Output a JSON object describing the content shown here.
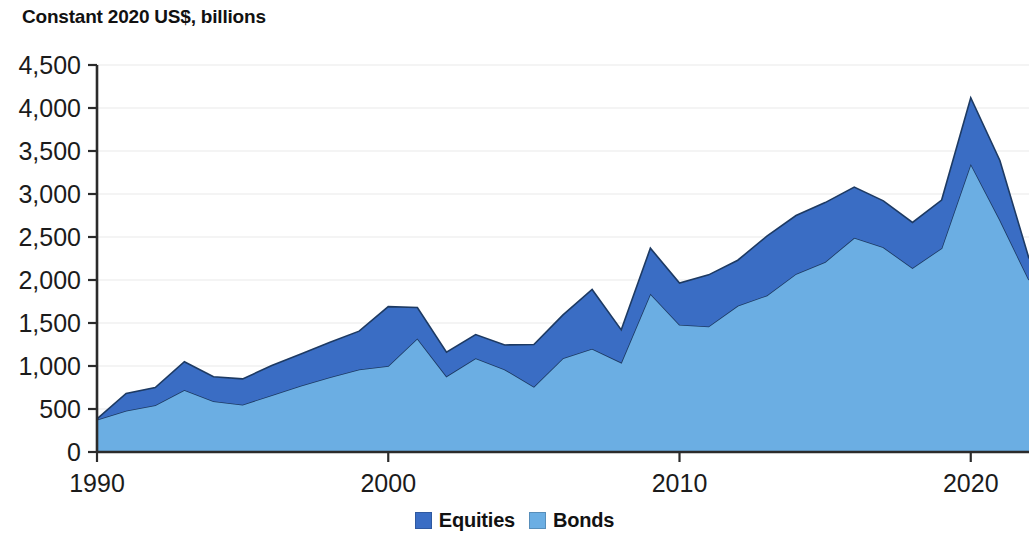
{
  "chart_data": {
    "type": "area",
    "stacked": true,
    "title": "Constant 2020 US$, billions",
    "xlabel": "",
    "ylabel": "",
    "ylim": [
      0,
      4500
    ],
    "xlim": [
      1990,
      2022
    ],
    "ytick_step": 500,
    "ytick_labels": [
      "0",
      "500",
      "1,000",
      "1,500",
      "2,000",
      "2,500",
      "3,000",
      "3,500",
      "4,000",
      "4,500"
    ],
    "ytick_values": [
      0,
      500,
      1000,
      1500,
      2000,
      2500,
      3000,
      3500,
      4000,
      4500
    ],
    "xtick_labels": [
      "1990",
      "2000",
      "2010",
      "2020"
    ],
    "xtick_values": [
      1990,
      2000,
      2010,
      2020
    ],
    "grid": true,
    "legend_position": "bottom",
    "x": [
      1990,
      1991,
      1992,
      1993,
      1994,
      1995,
      1996,
      1997,
      1998,
      1999,
      2000,
      2001,
      2002,
      2003,
      2004,
      2005,
      2006,
      2007,
      2008,
      2009,
      2010,
      2011,
      2012,
      2013,
      2014,
      2015,
      2016,
      2017,
      2018,
      2019,
      2020,
      2021,
      2022
    ],
    "series": [
      {
        "name": "Bonds",
        "color": "#6BAEE3",
        "values": [
          375,
          480,
          545,
          720,
          590,
          550,
          660,
          770,
          870,
          960,
          1000,
          1320,
          880,
          1090,
          960,
          760,
          1090,
          1200,
          1040,
          1840,
          1480,
          1460,
          1700,
          1820,
          2070,
          2210,
          2490,
          2380,
          2140,
          2370,
          3350,
          2700,
          2000
        ]
      },
      {
        "name": "Equities",
        "color": "#3A6DC4",
        "values": [
          10,
          200,
          205,
          330,
          285,
          300,
          345,
          370,
          405,
          445,
          690,
          360,
          280,
          275,
          285,
          490,
          505,
          690,
          380,
          530,
          485,
          600,
          530,
          690,
          680,
          690,
          590,
          540,
          530,
          560,
          770,
          690,
          250
        ]
      }
    ],
    "totals": [
      385,
      680,
      750,
      1050,
      875,
      850,
      1005,
      1140,
      1275,
      1405,
      1690,
      1680,
      1160,
      1365,
      1245,
      1250,
      1595,
      1890,
      1420,
      2370,
      1965,
      2060,
      2230,
      2510,
      2750,
      2900,
      3080,
      2920,
      2670,
      2930,
      4120,
      3390,
      2250
    ]
  },
  "legend": {
    "items": [
      {
        "label": "Equities",
        "color": "#3A6DC4"
      },
      {
        "label": "Bonds",
        "color": "#6BAEE3"
      }
    ]
  }
}
